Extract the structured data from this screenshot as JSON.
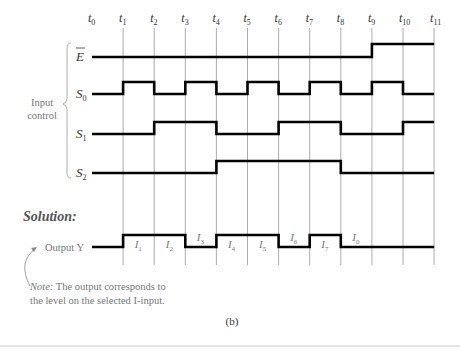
{
  "figure": {
    "caption": "(b)",
    "time_labels": [
      "t0",
      "t1",
      "t2",
      "t3",
      "t4",
      "t5",
      "t6",
      "t7",
      "t8",
      "t9",
      "t10",
      "t11"
    ],
    "group_label": [
      "Input",
      "control"
    ],
    "signals": [
      {
        "name": "E",
        "overbar": true,
        "levels": [
          0,
          0,
          0,
          0,
          0,
          0,
          0,
          0,
          0,
          1,
          1
        ]
      },
      {
        "name": "S0",
        "levels": [
          0,
          1,
          0,
          1,
          0,
          1,
          0,
          1,
          0,
          1,
          0
        ]
      },
      {
        "name": "S1",
        "levels": [
          0,
          0,
          1,
          1,
          0,
          0,
          1,
          1,
          0,
          0,
          1
        ]
      },
      {
        "name": "S2",
        "levels": [
          0,
          0,
          0,
          0,
          1,
          1,
          1,
          1,
          0,
          0,
          0
        ]
      }
    ],
    "solution_label": "Solution:",
    "output": {
      "label": "Output Y",
      "levels": [
        0,
        1,
        1,
        0,
        1,
        1,
        0,
        1,
        0,
        0,
        0
      ],
      "interval_labels": [
        "",
        "I1",
        "I2",
        "I3",
        "I4",
        "I5",
        "I6",
        "I7",
        "I0",
        "",
        ""
      ]
    },
    "note": {
      "prefix": "Note:",
      "line1": " The output corresponds to",
      "line2": "the level on the selected I-input."
    }
  }
}
